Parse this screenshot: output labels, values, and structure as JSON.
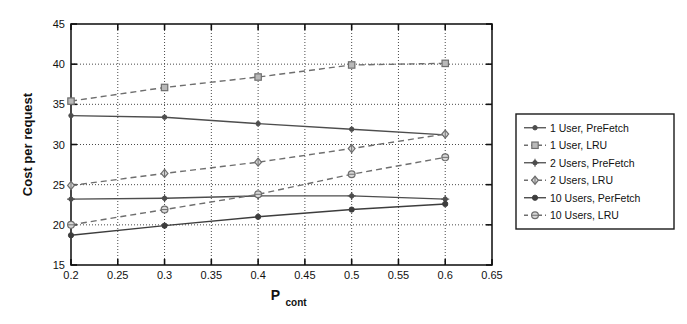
{
  "chart_data": {
    "type": "line",
    "title": "",
    "xlabel": "P_cont",
    "xlabel_main": "P",
    "xlabel_sub": "cont",
    "ylabel": "Cost per request",
    "xlim": [
      0.2,
      0.65
    ],
    "ylim": [
      15,
      45
    ],
    "xticks": [
      0.2,
      0.25,
      0.3,
      0.35,
      0.4,
      0.45,
      0.5,
      0.55,
      0.6,
      0.65
    ],
    "xticklabels": [
      "0.2",
      "0.25",
      "0.3",
      "0.35",
      "0.4",
      "0.45",
      "0.5",
      "0.55",
      "0.6",
      "0.65"
    ],
    "yticks": [
      15,
      20,
      25,
      30,
      35,
      40,
      45
    ],
    "yticklabels": [
      "15",
      "20",
      "25",
      "30",
      "35",
      "40",
      "45"
    ],
    "grid": true,
    "grid_style": "dotted",
    "legend_position": "right-outside",
    "x": [
      0.2,
      0.3,
      0.4,
      0.5,
      0.6
    ],
    "series": [
      {
        "name": "1 User, PreFetch",
        "values": [
          33.6,
          33.4,
          32.6,
          31.9,
          31.2
        ],
        "linestyle": "solid",
        "marker": "dot",
        "color": "#4d4d4d"
      },
      {
        "name": "1 User, LRU",
        "values": [
          35.4,
          37.1,
          38.4,
          39.9,
          40.1
        ],
        "linestyle": "dashed",
        "marker": "square",
        "color": "#6e6e6e"
      },
      {
        "name": "2 Users, PreFetch",
        "values": [
          23.2,
          23.3,
          23.6,
          23.6,
          23.2
        ],
        "linestyle": "solid",
        "marker": "star",
        "color": "#4d4d4d"
      },
      {
        "name": "2 Users, LRU",
        "values": [
          24.9,
          26.4,
          27.8,
          29.5,
          31.3
        ],
        "linestyle": "dashed",
        "marker": "diamond",
        "color": "#6e6e6e"
      },
      {
        "name": "10 Users, PerFetch",
        "values": [
          18.7,
          19.9,
          21.0,
          21.9,
          22.6
        ],
        "linestyle": "solid",
        "marker": "filled-dot",
        "color": "#3d3d3d"
      },
      {
        "name": "10 Users, LRU",
        "values": [
          20.0,
          21.9,
          23.8,
          26.3,
          28.4
        ],
        "linestyle": "dashed",
        "marker": "circle",
        "color": "#6e6e6e"
      }
    ]
  },
  "legend": {
    "entries": [
      {
        "label": "1 User, PreFetch"
      },
      {
        "label": "1 User, LRU"
      },
      {
        "label": "2 Users, PreFetch"
      },
      {
        "label": "2 Users, LRU"
      },
      {
        "label": "10 Users, PerFetch"
      },
      {
        "label": "10 Users, LRU"
      }
    ]
  }
}
